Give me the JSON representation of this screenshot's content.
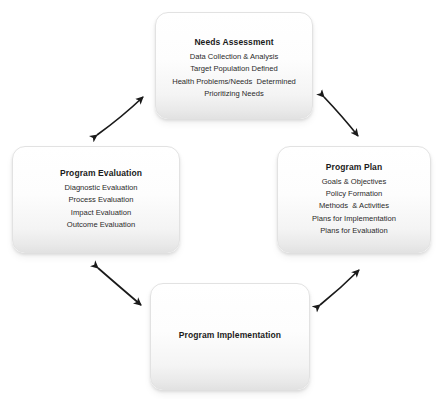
{
  "diagram": {
    "background_color": "#ffffff",
    "node_fill_color": "#f7f7f7",
    "node_border_color": "#e2e2e2",
    "arrow_color": "#1a1a1a",
    "nodes": [
      {
        "id": "needs-assessment",
        "title": "Needs Assessment",
        "lines": [
          "Data Collection & Analysis",
          "Target Population Defined",
          "Health Problems/Needs  Determined",
          "Prioritizing Needs"
        ]
      },
      {
        "id": "program-evaluation",
        "title": "Program Evaluation",
        "lines": [
          "Diagnostic Evaluation",
          "Process Evaluation",
          "Impact Evaluation",
          "Outcome Evaluation"
        ]
      },
      {
        "id": "program-plan",
        "title": "Program Plan",
        "lines": [
          "Goals & Objectives",
          "Policy Formation",
          "Methods  & Activities",
          "Plans for Implementation",
          "Plans for Evaluation"
        ]
      },
      {
        "id": "program-implementation",
        "title": "Program Implementation",
        "lines": []
      }
    ],
    "connectors": [
      {
        "id": "needs-to-evaluation",
        "from": "program-evaluation",
        "to": "needs-assessment",
        "style": "double-headed-arrow"
      },
      {
        "id": "needs-to-plan",
        "from": "needs-assessment",
        "to": "program-plan",
        "style": "double-headed-arrow"
      },
      {
        "id": "evaluation-to-implementation",
        "from": "program-evaluation",
        "to": "program-implementation",
        "style": "double-headed-arrow"
      },
      {
        "id": "implementation-to-plan",
        "from": "program-implementation",
        "to": "program-plan",
        "style": "double-headed-arrow"
      }
    ]
  }
}
